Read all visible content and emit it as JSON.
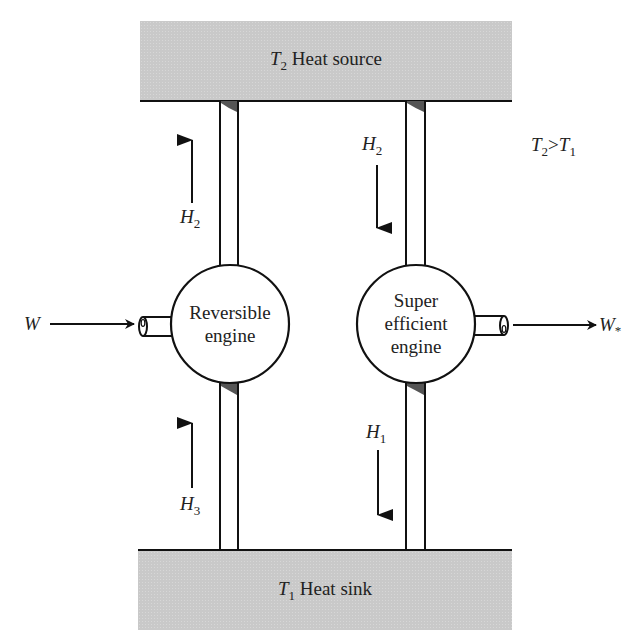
{
  "diagram": {
    "top_reservoir": {
      "symbol": "T",
      "subscript": "2",
      "label": "Heat source"
    },
    "bottom_reservoir": {
      "symbol": "T",
      "subscript": "1",
      "label": "Heat sink"
    },
    "condition": {
      "left": "T",
      "left_sub": "2",
      "op": ">",
      "right": "T",
      "right_sub": "1"
    },
    "left_engine": {
      "line1": "Reversible",
      "line2": "engine",
      "work_label": "W",
      "upper_heat": {
        "symbol": "H",
        "subscript": "2",
        "direction": "up"
      },
      "lower_heat": {
        "symbol": "H",
        "subscript": "3",
        "direction": "up"
      }
    },
    "right_engine": {
      "line1": "Super",
      "line2": "efficient",
      "line3": "engine",
      "work_label": "W",
      "work_sub": "*",
      "upper_heat": {
        "symbol": "H",
        "subscript": "2",
        "direction": "down"
      },
      "lower_heat": {
        "symbol": "H",
        "subscript": "1",
        "direction": "down"
      }
    },
    "colors": {
      "reservoir_fill": "#c9c9c9",
      "line": "#111111",
      "pipe_shade": "#555555",
      "background": "#ffffff"
    }
  }
}
